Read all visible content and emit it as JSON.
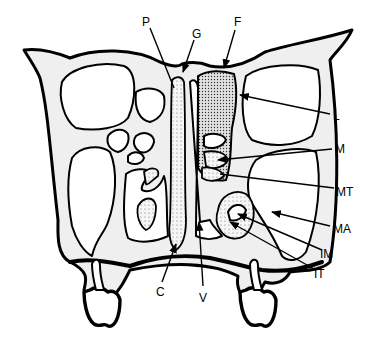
{
  "diagram": {
    "labels": {
      "P": "P",
      "G": "G",
      "F": "F",
      "L": "L",
      "M": "M",
      "MT": "MT",
      "MA": "MA",
      "IM": "IM",
      "IT": "IT",
      "C": "C",
      "V": "V"
    },
    "colors": {
      "ink": "#000000",
      "background": "#ffffff",
      "bone": "#f4f4f4"
    }
  }
}
